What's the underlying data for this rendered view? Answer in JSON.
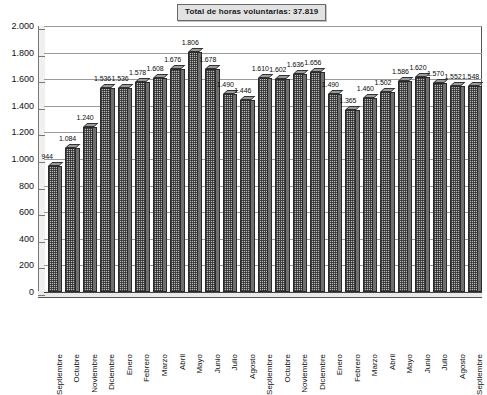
{
  "chart_data": {
    "type": "bar",
    "title": "Total de horas voluntarias: 37.819",
    "xlabel": "",
    "ylabel": "",
    "ylim": [
      0,
      2000
    ],
    "ytick_labels": [
      "2.000",
      "1.800",
      "1.600",
      "1.400",
      "1.200",
      "1.000",
      "800",
      "600",
      "400",
      "200",
      "0"
    ],
    "ytick_values": [
      2000,
      1800,
      1600,
      1400,
      1200,
      1000,
      800,
      600,
      400,
      200,
      0
    ],
    "grid": true,
    "legend": "none",
    "categories": [
      "Septiembre",
      "Octubre",
      "Noviembre",
      "Diciembre",
      "Enero",
      "Febrero",
      "Marzo",
      "Abril",
      "Mayo",
      "Junio",
      "Julio",
      "Agosto",
      "Septiembre",
      "Octubre",
      "Noviembre",
      "Diciembre",
      "Enero",
      "Febrero",
      "Marzo",
      "Abril",
      "Mayo",
      "Junio",
      "Julio",
      "Agosto",
      "Septiembre"
    ],
    "values": [
      944,
      1084,
      1240,
      1536,
      1536,
      1578,
      1608,
      1676,
      1806,
      1678,
      1490,
      1446,
      1610,
      1602,
      1636,
      1656,
      1490,
      1365,
      1460,
      1502,
      1586,
      1620,
      1570,
      1552,
      1548
    ],
    "value_labels": [
      "944",
      "1.084",
      "1.240",
      "1.536",
      "1.536",
      "1.578",
      "1.608",
      "1.676",
      "1.806",
      "1.678",
      "1.490",
      "1.446",
      "1.610",
      "1.602",
      "1.636",
      "1.656",
      "1.490",
      "1.365",
      "1.460",
      "1.502",
      "1.586",
      "1.620",
      "1.570",
      "1.552",
      "1.548"
    ],
    "bar_color": "#b9b9b9",
    "bar_edge_color": "#2a2a2a",
    "plot_background": "#ffffff",
    "title_background": "#e2e2e2"
  }
}
